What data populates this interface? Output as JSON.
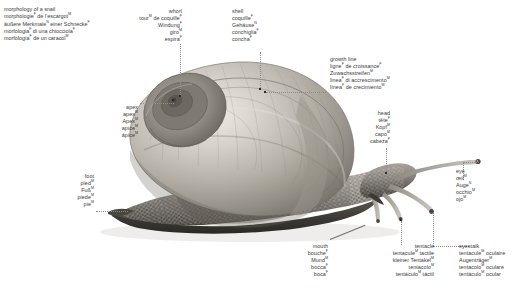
{
  "title": {
    "lines": [
      {
        "text": "morphology of a snail",
        "sup": ""
      },
      {
        "text": "morphologie",
        "sup": "F",
        "tail": " de l’escargot",
        "tail_sup": "M"
      },
      {
        "text": "äußere Merkmale",
        "sup": "N",
        "tail": " einer Schnecke",
        "tail_sup": "F"
      },
      {
        "text": "morfologia",
        "sup": "F",
        "tail": " di una chiocciola",
        "tail_sup": "F"
      },
      {
        "text": "morfología",
        "sup": "F",
        "tail": " de un caracol",
        "tail_sup": "M"
      }
    ]
  },
  "labels": {
    "whorl": {
      "name": "whorl",
      "align": "right",
      "lines": [
        {
          "text": "whorl",
          "sup": ""
        },
        {
          "text": "tour",
          "sup": "M",
          "tail": " de coquille",
          "tail_sup": "F"
        },
        {
          "text": "Windung",
          "sup": "F",
          "tail": "",
          "tail_sup": ""
        },
        {
          "text": "giro",
          "sup": "M",
          "tail": "",
          "tail_sup": ""
        },
        {
          "text": "espira",
          "sup": "F",
          "tail": "",
          "tail_sup": ""
        }
      ]
    },
    "shell": {
      "name": "shell",
      "align": "left",
      "lines": [
        {
          "text": "shell",
          "sup": ""
        },
        {
          "text": "coquille",
          "sup": "F",
          "tail": "",
          "tail_sup": ""
        },
        {
          "text": "Gehäuse",
          "sup": "N",
          "tail": "",
          "tail_sup": ""
        },
        {
          "text": "conchiglia",
          "sup": "F",
          "tail": "",
          "tail_sup": ""
        },
        {
          "text": "concha",
          "sup": "F",
          "tail": "",
          "tail_sup": ""
        }
      ]
    },
    "growth_line": {
      "name": "growth line",
      "align": "left",
      "lines": [
        {
          "text": "growth line",
          "sup": ""
        },
        {
          "text": "ligne",
          "sup": "F",
          "tail": " de croissance",
          "tail_sup": "F"
        },
        {
          "text": "Zuwachsstreifen",
          "sup": "M",
          "tail": "",
          "tail_sup": ""
        },
        {
          "text": "linea",
          "sup": "F",
          "tail": " di accrescimento",
          "tail_sup": "M"
        },
        {
          "text": "línea",
          "sup": "F",
          "tail": " de crecimiento",
          "tail_sup": "M"
        }
      ]
    },
    "head": {
      "name": "head",
      "align": "right",
      "lines": [
        {
          "text": "head",
          "sup": ""
        },
        {
          "text": "tête",
          "sup": "F",
          "tail": "",
          "tail_sup": ""
        },
        {
          "text": "Kopf",
          "sup": "M",
          "tail": "",
          "tail_sup": ""
        },
        {
          "text": "capo",
          "sup": "M",
          "tail": "",
          "tail_sup": ""
        },
        {
          "text": "cabeza",
          "sup": "F",
          "tail": "",
          "tail_sup": ""
        }
      ]
    },
    "eye": {
      "name": "eye",
      "align": "left",
      "lines": [
        {
          "text": "eye",
          "sup": ""
        },
        {
          "text": "œil",
          "sup": "M",
          "tail": "",
          "tail_sup": ""
        },
        {
          "text": "Auge",
          "sup": "N",
          "tail": "",
          "tail_sup": ""
        },
        {
          "text": "occhio",
          "sup": "M",
          "tail": "",
          "tail_sup": ""
        },
        {
          "text": "ojo",
          "sup": "M",
          "tail": "",
          "tail_sup": ""
        }
      ]
    },
    "eyestalk": {
      "name": "eyestalk",
      "align": "left",
      "lines": [
        {
          "text": "eyestalk",
          "sup": ""
        },
        {
          "text": "tentacule",
          "sup": "M",
          "tail": " oculaire",
          "tail_sup": ""
        },
        {
          "text": "Augenträger",
          "sup": "M",
          "tail": "",
          "tail_sup": ""
        },
        {
          "text": "tentacolo",
          "sup": "M",
          "tail": " oculare",
          "tail_sup": ""
        },
        {
          "text": "tentáculo",
          "sup": "M",
          "tail": " ocular",
          "tail_sup": ""
        }
      ]
    },
    "tentacle": {
      "name": "tentacle",
      "align": "right",
      "lines": [
        {
          "text": "tentacle",
          "sup": ""
        },
        {
          "text": "tentacule",
          "sup": "M",
          "tail": " tactile",
          "tail_sup": ""
        },
        {
          "text": "kleiner Tentakel",
          "sup": "M",
          "tail": "",
          "tail_sup": ""
        },
        {
          "text": "tentacolo",
          "sup": "M",
          "tail": "",
          "tail_sup": ""
        },
        {
          "text": "tentáculo",
          "sup": "M",
          "tail": " táctil",
          "tail_sup": ""
        }
      ]
    },
    "mouth": {
      "name": "mouth",
      "align": "right",
      "lines": [
        {
          "text": "mouth",
          "sup": ""
        },
        {
          "text": "bouche",
          "sup": "F",
          "tail": "",
          "tail_sup": ""
        },
        {
          "text": "Mund",
          "sup": "M",
          "tail": "",
          "tail_sup": ""
        },
        {
          "text": "bocca",
          "sup": "F",
          "tail": "",
          "tail_sup": ""
        },
        {
          "text": "boca",
          "sup": "F",
          "tail": "",
          "tail_sup": ""
        }
      ]
    },
    "foot": {
      "name": "foot",
      "align": "right",
      "lines": [
        {
          "text": "foot",
          "sup": ""
        },
        {
          "text": "pied",
          "sup": "M",
          "tail": "",
          "tail_sup": ""
        },
        {
          "text": "Fuß",
          "sup": "M",
          "tail": "",
          "tail_sup": ""
        },
        {
          "text": "piede",
          "sup": "M",
          "tail": "",
          "tail_sup": ""
        },
        {
          "text": "pie",
          "sup": "M",
          "tail": "",
          "tail_sup": ""
        }
      ]
    },
    "apex": {
      "name": "apex",
      "align": "right",
      "lines": [
        {
          "text": "apex",
          "sup": ""
        },
        {
          "text": "apex",
          "sup": "M",
          "tail": "",
          "tail_sup": ""
        },
        {
          "text": "Apex",
          "sup": "M",
          "tail": "",
          "tail_sup": ""
        },
        {
          "text": "apice",
          "sup": "M",
          "tail": "",
          "tail_sup": ""
        },
        {
          "text": "ápice",
          "sup": "M",
          "tail": "",
          "tail_sup": ""
        }
      ]
    }
  },
  "colors": {
    "text": "#3a3a3a",
    "leader": "#8d8d8d",
    "marker": "#2b2b2b",
    "background": "#ffffff",
    "shell_light": "#d8d5ce",
    "shell_mid": "#a9a59c",
    "shell_dark": "#6f6b63",
    "body_dark": "#5d5a55"
  }
}
